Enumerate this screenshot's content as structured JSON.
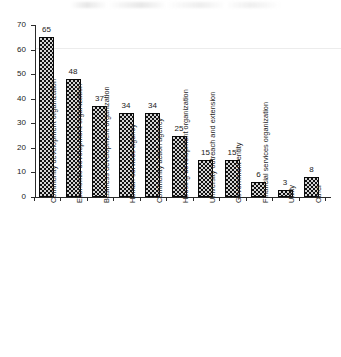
{
  "chart_data": {
    "type": "bar",
    "title": "",
    "subtitle": "",
    "xlabel": "",
    "ylabel": "",
    "ylim": [
      0,
      70
    ],
    "ytick_labels": [
      "0",
      "10",
      "20",
      "30",
      "40",
      "50",
      "60",
      "70"
    ],
    "ytick_values": [
      0,
      10,
      20,
      30,
      40,
      50,
      60,
      70
    ],
    "grid": false,
    "legend": null,
    "orientation": "vertical",
    "data_labels_shown": true,
    "categories": [
      "Community development organization",
      "Economic development organization",
      "Business development organization",
      "Human services agency",
      "Community action agency",
      "Housing development organization",
      "University outreach and extension",
      "Government entity",
      "Financial services organization",
      "Utility",
      "Other"
    ],
    "values": [
      65,
      48,
      37,
      34,
      34,
      25,
      15,
      15,
      6,
      3,
      8
    ],
    "bar_color": "#111111",
    "bar_pattern": "stippled-dots"
  }
}
